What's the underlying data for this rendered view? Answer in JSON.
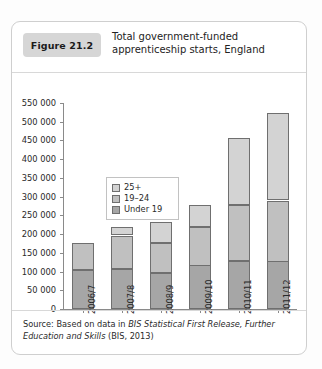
{
  "figure": {
    "badge": "Figure 21.2",
    "title": "Total government-funded apprenticeship starts, England"
  },
  "source": {
    "prefix": "Source: Based on data in ",
    "italic": "BIS Statistical First Release, Further Education and Skills",
    "suffix": " (BIS, 2013)"
  },
  "legend": {
    "position": "inside-top-left",
    "entries": [
      {
        "label": "25+",
        "color": "#d3d3d3"
      },
      {
        "label": "19–24",
        "color": "#c0c0c0"
      },
      {
        "label": "Under 19",
        "color": "#a6a6a6"
      }
    ]
  },
  "chart_data": {
    "type": "bar",
    "stacked": true,
    "title": "Total government-funded apprenticeship starts, England",
    "xlabel": "",
    "ylabel": "",
    "grid": false,
    "ylim": [
      0,
      550000
    ],
    "ytick_step": 50000,
    "ytick_labels": [
      "550 000",
      "500 000",
      "450 000",
      "400 000",
      "350 000",
      "300 000",
      "250 000",
      "200 000",
      "150 000",
      "100 000",
      "50 000",
      "0"
    ],
    "ytick_values": [
      550000,
      500000,
      450000,
      400000,
      350000,
      300000,
      250000,
      200000,
      150000,
      100000,
      50000,
      0
    ],
    "categories": [
      "2006/7",
      "2007/8",
      "2008/9",
      "2009/10",
      "2010/11",
      "2011/12"
    ],
    "series": [
      {
        "name": "Under 19",
        "color": "#a6a6a6",
        "values": [
          104000,
          108000,
          97000,
          117000,
          127000,
          127000
        ]
      },
      {
        "name": "19–24",
        "color": "#c0c0c0",
        "values": [
          73000,
          88000,
          79000,
          103000,
          150000,
          162000
        ]
      },
      {
        "name": "25+",
        "color": "#d3d3d3",
        "values": [
          0,
          22000,
          55000,
          59000,
          180000,
          233000
        ]
      }
    ],
    "totals": [
      177000,
      218000,
      231000,
      279000,
      457000,
      522000
    ]
  }
}
